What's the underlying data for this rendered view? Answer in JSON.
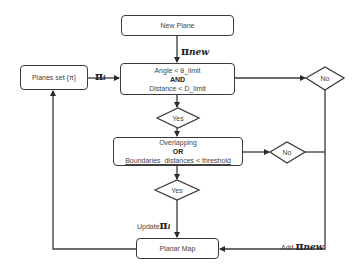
{
  "diagram": {
    "type": "flowchart",
    "nodes": {
      "new_plane": {
        "label": "New Plane"
      },
      "planes_set": {
        "label": "Planes set {π}"
      },
      "condition1": {
        "line1": "Angle < θ_limit",
        "line2": "AND",
        "line3": "Distance < D_limit"
      },
      "yes1": {
        "label": "Yes"
      },
      "no1": {
        "label": "No"
      },
      "condition2": {
        "line1": "Overlapping",
        "line2": "OR",
        "line3": "Boundaries_distances < threshold"
      },
      "yes2": {
        "label": "Yes"
      },
      "no2": {
        "label": "No"
      },
      "planar_map": {
        "label": "Planar Map"
      }
    },
    "edge_labels": {
      "pi_new_top": {
        "symbol": "π",
        "subscript": "new"
      },
      "pi_i": {
        "symbol": "π",
        "subscript": "i"
      },
      "update": {
        "prefix": "Update",
        "symbol": "π",
        "subscript": "i"
      },
      "add": {
        "prefix": "Add ",
        "symbol": "π",
        "subscript": "new"
      }
    },
    "edges": [
      {
        "from": "New Plane",
        "to": "Angle/Distance check",
        "label": "π_new"
      },
      {
        "from": "Planes set {π}",
        "to": "Angle/Distance check",
        "label": "π_i"
      },
      {
        "from": "Angle/Distance check",
        "to": "Yes"
      },
      {
        "from": "Angle/Distance check",
        "to": "No"
      },
      {
        "from": "Yes",
        "to": "Overlapping/Boundaries check"
      },
      {
        "from": "Overlapping/Boundaries check",
        "to": "Yes"
      },
      {
        "from": "Overlapping/Boundaries check",
        "to": "No"
      },
      {
        "from": "Yes",
        "to": "Planar Map",
        "label": "Update π_i"
      },
      {
        "from": "No",
        "to": "Planar Map",
        "label": "Add π_new"
      },
      {
        "from": "Planar Map",
        "to": "Planes set {π}"
      }
    ]
  }
}
